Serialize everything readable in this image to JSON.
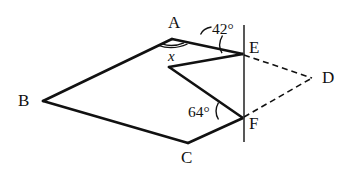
{
  "figure": {
    "type": "geometry-diagram",
    "background_color": "#ffffff",
    "stroke_color": "#111111",
    "canvas": {
      "width": 359,
      "height": 177
    },
    "vertices": [
      {
        "id": "A",
        "label": "A",
        "x": 172,
        "y": 39,
        "label_x": 168,
        "label_y": 14
      },
      {
        "id": "B",
        "label": "B",
        "x": 43,
        "y": 101,
        "label_x": 18,
        "label_y": 92
      },
      {
        "id": "C",
        "label": "C",
        "x": 188,
        "y": 143,
        "label_x": 181,
        "label_y": 149
      },
      {
        "id": "D",
        "label": "D",
        "x": 313,
        "y": 78,
        "label_x": 322,
        "label_y": 69
      },
      {
        "id": "E",
        "label": "E",
        "x": 243,
        "y": 54,
        "label_x": 249,
        "label_y": 39
      },
      {
        "id": "F",
        "label": "F",
        "x": 243,
        "y": 118,
        "label_x": 249,
        "label_y": 115
      },
      {
        "id": "G",
        "label": "",
        "x": 169,
        "y": 67,
        "label_x": 0,
        "label_y": 0
      }
    ],
    "solid_edges": [
      {
        "from": "A",
        "to": "B"
      },
      {
        "from": "B",
        "to": "C"
      },
      {
        "from": "C",
        "to": "F"
      },
      {
        "from": "A",
        "to": "E"
      },
      {
        "from": "E",
        "to": "G"
      },
      {
        "from": "G",
        "to": "F"
      }
    ],
    "dashed_edges": [
      {
        "from": "E",
        "to": "D"
      },
      {
        "from": "F",
        "to": "D"
      }
    ],
    "vertical_line": {
      "x": 244,
      "y_top": 25,
      "y_bottom": 142
    },
    "angle_labels": [
      {
        "id": "angle-42",
        "text": "42°",
        "x": 212,
        "y": 21
      },
      {
        "id": "angle-64",
        "text": "64°",
        "x": 188,
        "y": 104
      },
      {
        "id": "angle-x",
        "text": "x",
        "x": 168,
        "y": 49
      }
    ]
  }
}
